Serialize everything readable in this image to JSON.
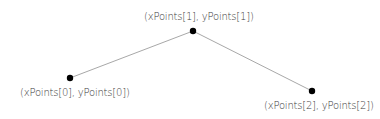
{
  "diagram": {
    "type": "polyline",
    "line_color": "#a8a8a8",
    "point_color": "#000000",
    "points": [
      {
        "x": 70,
        "y": 78,
        "label": "(xPoints[0], yPoints[0])",
        "label_x": 20,
        "label_y": 87
      },
      {
        "x": 193,
        "y": 31,
        "label": "(xPoints[1], yPoints[1])",
        "label_x": 144,
        "label_y": 11
      },
      {
        "x": 312,
        "y": 91,
        "label": "(xPoints[2], yPoints[2])",
        "label_x": 264,
        "label_y": 100
      }
    ]
  }
}
